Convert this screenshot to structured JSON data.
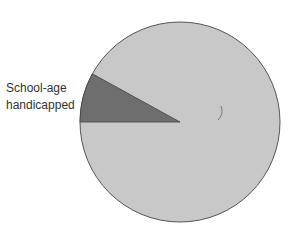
{
  "chart_data": {
    "type": "pie",
    "title": "",
    "slices": [
      {
        "label": "School-age handicapped",
        "value": 8,
        "color": "#6e6e6e"
      },
      {
        "label": "Other",
        "value": 92,
        "color": "#c8c8c8"
      }
    ],
    "annotations": [
      "School-age handicapped"
    ],
    "legend": "none",
    "grid": false
  },
  "labels": {
    "line1": "School-age",
    "line2": "handicapped"
  },
  "colors": {
    "slice_dark": "#6e6e6e",
    "slice_light": "#c8c8c8",
    "outline": "#555555"
  }
}
